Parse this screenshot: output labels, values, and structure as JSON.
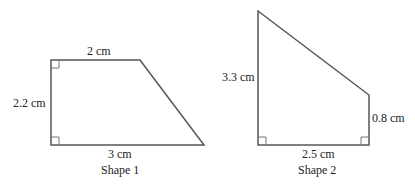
{
  "shapes": [
    {
      "name": "Shape 1",
      "kind": "right trapezoid",
      "labels": {
        "top": "2 cm",
        "left": "2.2 cm",
        "bottom": "3 cm"
      },
      "caption": "Shape 1",
      "right_angles": [
        "top-left",
        "bottom-left"
      ]
    },
    {
      "name": "Shape 2",
      "kind": "right trapezoid",
      "labels": {
        "left": "3.3 cm",
        "right": "0.8 cm",
        "bottom": "2.5 cm"
      },
      "caption": "Shape 2",
      "right_angles": [
        "bottom-left",
        "bottom-right"
      ]
    }
  ],
  "colors": {
    "stroke": "#555555",
    "text": "#222222"
  }
}
